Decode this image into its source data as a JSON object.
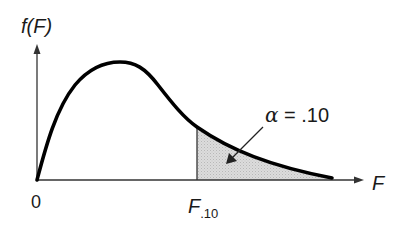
{
  "diagram": {
    "y_axis_label": "f(F)",
    "x_axis_label": "F",
    "origin_label": "0",
    "critical_value": {
      "symbol": "F",
      "subscript": ".10"
    },
    "annotation": {
      "symbol": "α",
      "equals": " = ",
      "value": ".10"
    },
    "colors": {
      "curve": "#000000",
      "axes": "#333333",
      "shaded_region": "#d4d4d4"
    }
  }
}
